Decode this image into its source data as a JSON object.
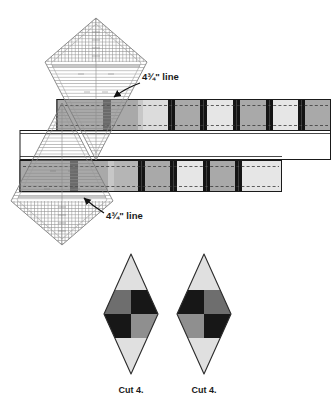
{
  "figure": {
    "type": "quilting-pattern-cutting-diagram",
    "background_color": "#ffffff"
  },
  "annotations": [
    {
      "id": "top-ruler-label",
      "text": "4¾\" line",
      "x": 142,
      "y": 80,
      "arrow_from": [
        139,
        84
      ],
      "arrow_to": [
        113,
        98
      ]
    },
    {
      "id": "bottom-ruler-label",
      "text": "4¾\" line",
      "x": 106,
      "y": 219,
      "arrow_from": [
        104,
        214
      ],
      "arrow_to": [
        82,
        197
      ]
    }
  ],
  "strips": {
    "colors": {
      "seam_line": "#111111",
      "dark_bar": "#141414",
      "medium_gray": "#a9a9a9",
      "light_gray": "#e3e3e3",
      "outline": "#1a1a1a",
      "dashed_guide": "#333333",
      "backing": "#ffffff"
    },
    "top_row": {
      "x": 57,
      "y": 99,
      "width": 274,
      "height": 31,
      "segments": [
        {
          "fill": "medium_gray",
          "width": 40
        },
        {
          "fill": "medium_gray",
          "width": 40
        },
        {
          "fill": "medium_gray",
          "width": 26
        },
        {
          "fill": "light_gray",
          "width": 26
        },
        {
          "fill": "medium_gray",
          "width": 26
        },
        {
          "fill": "light_gray",
          "width": 26
        },
        {
          "fill": "medium_gray",
          "width": 26
        },
        {
          "fill": "light_gray",
          "width": 26
        }
      ]
    },
    "middle_row": {
      "x": 20,
      "y": 130,
      "width": 311,
      "height": 30,
      "fill": "backing"
    },
    "bottom_row": {
      "x": 20,
      "y": 160,
      "width": 262,
      "height": 32,
      "segments": [
        {
          "fill": "medium_gray",
          "width": 48
        },
        {
          "fill": "medium_gray",
          "width": 40
        },
        {
          "fill": "medium_gray",
          "width": 26
        },
        {
          "fill": "light_gray",
          "width": 26
        },
        {
          "fill": "medium_gray",
          "width": 26
        },
        {
          "fill": "light_gray",
          "width": 26
        },
        {
          "fill": "medium_gray",
          "width": 26
        },
        {
          "fill": "light_gray",
          "width": 26
        }
      ]
    }
  },
  "rulers": [
    {
      "id": "top-ruler",
      "orientation": "point-up",
      "apex": [
        96,
        18
      ],
      "left": [
        45,
        62
      ],
      "right": [
        147,
        62
      ],
      "bottom": [
        96,
        160
      ],
      "line_color": "#6b6b6b",
      "rule_spacing": 5
    },
    {
      "id": "bottom-ruler",
      "orientation": "point-down",
      "apex": [
        62,
        245
      ],
      "left": [
        11,
        201
      ],
      "right": [
        113,
        201
      ],
      "top": [
        62,
        103
      ],
      "line_color": "#6b6b6b",
      "rule_spacing": 5
    }
  ],
  "diamonds": [
    {
      "id": "diamond-left",
      "label": "Cut 4.",
      "label_x": 131,
      "label_y": 393,
      "cx": 131,
      "top_y": 254,
      "bottom_y": 374,
      "half_width": 27,
      "band_top": 290,
      "band_mid": 314,
      "band_bottom": 338,
      "tip_fill": "#e0e0e0",
      "quadrants": {
        "top_left": "#6e6e6e",
        "top_right": "#171717",
        "bottom_left": "#171717",
        "bottom_right": "#8f8f8f"
      }
    },
    {
      "id": "diamond-right",
      "label": "Cut 4.",
      "label_x": 204,
      "label_y": 393,
      "cx": 204,
      "top_y": 254,
      "bottom_y": 374,
      "half_width": 27,
      "band_top": 290,
      "band_mid": 314,
      "band_bottom": 338,
      "tip_fill": "#e0e0e0",
      "quadrants": {
        "top_left": "#171717",
        "top_right": "#6e6e6e",
        "bottom_left": "#8f8f8f",
        "bottom_right": "#171717"
      }
    }
  ]
}
